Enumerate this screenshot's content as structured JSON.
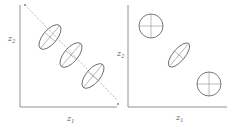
{
  "panels": [
    {
      "id": "left",
      "x_label": "z",
      "x_sub": "1",
      "y_label": "z",
      "y_sub": "2",
      "has_dashed_diagonal": true,
      "shapes": [
        {
          "type": "ellipse",
          "cx": 50,
          "cy": 37,
          "rx": 15,
          "ry": 7,
          "rotate": -50
        },
        {
          "type": "ellipse",
          "cx": 71,
          "cy": 55,
          "rx": 15,
          "ry": 7,
          "rotate": -50
        },
        {
          "type": "ellipse",
          "cx": 93,
          "cy": 76,
          "rx": 15,
          "ry": 7,
          "rotate": -50
        }
      ]
    },
    {
      "id": "right",
      "x_label": "z",
      "x_sub": "1",
      "y_label": "z",
      "y_sub": "2",
      "has_dashed_diagonal": false,
      "shapes": [
        {
          "type": "circle",
          "cx": 151,
          "cy": 26,
          "r": 12
        },
        {
          "type": "ellipse",
          "cx": 179,
          "cy": 55,
          "rx": 15,
          "ry": 6,
          "rotate": -50
        },
        {
          "type": "circle",
          "cx": 209,
          "cy": 84,
          "r": 12
        }
      ]
    }
  ],
  "colors": {
    "stroke": "#555555",
    "axis": "#777777",
    "dashed": "#999999"
  }
}
